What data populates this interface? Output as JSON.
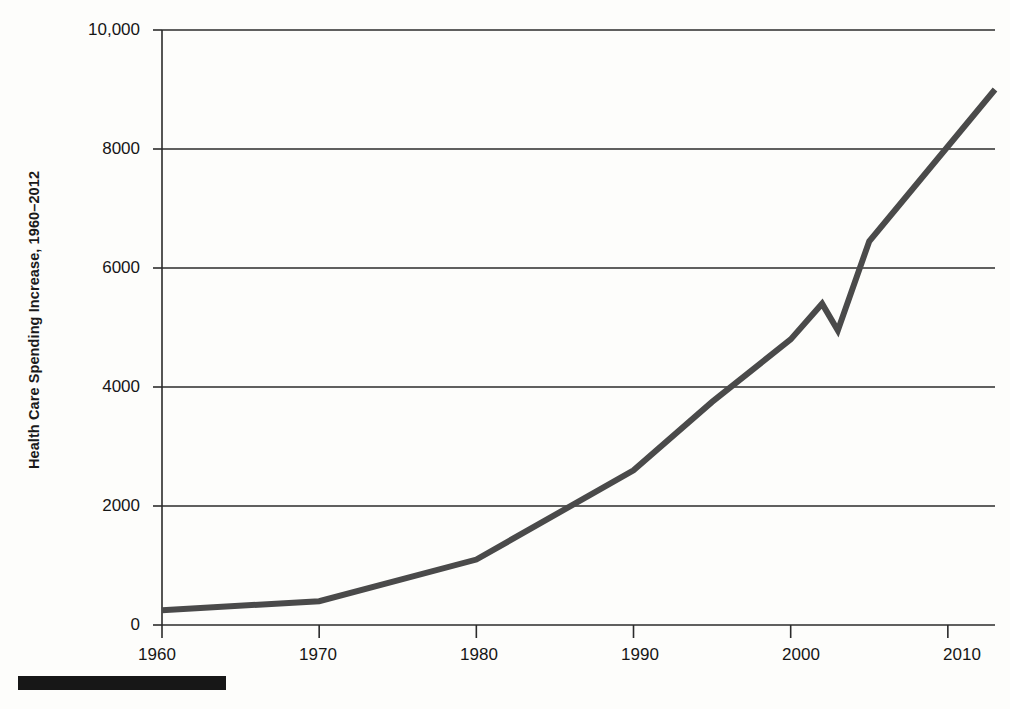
{
  "chart_data": {
    "type": "line",
    "title": "",
    "subtitle": "",
    "xlabel": "",
    "ylabel": "Health Care Spending Increase, 1960–2012",
    "xlim": [
      1960,
      2013
    ],
    "ylim": [
      0,
      10000
    ],
    "grid": "horizontal",
    "legend": "none",
    "xticks": [
      "1960",
      "1970",
      "1980",
      "1990",
      "2000",
      "2010"
    ],
    "xtick_values": [
      1960,
      1970,
      1980,
      1990,
      2000,
      2010
    ],
    "yticks": [
      "0",
      "2000",
      "4000",
      "6000",
      "8000",
      "10,000"
    ],
    "ytick_values": [
      0,
      2000,
      4000,
      6000,
      8000,
      10000
    ],
    "series": [
      {
        "name": "Health Care Spending Increase",
        "color": "#4a4a4a",
        "line_width": 6,
        "x": [
          1960,
          1970,
          1980,
          1990,
          1995,
          2000,
          2002,
          2003,
          2005,
          2013
        ],
        "values": [
          250,
          400,
          1100,
          2600,
          3750,
          4800,
          5400,
          4950,
          6450,
          9000
        ]
      }
    ],
    "annotations": []
  },
  "axis": {
    "y_label": "Health Care Spending Increase, 1960–2012",
    "y_tick_labels": [
      "10,000",
      "8000",
      "6000",
      "4000",
      "2000",
      "0"
    ],
    "x_tick_labels": [
      "1960",
      "1970",
      "1980",
      "1990",
      "2000",
      "2010"
    ]
  },
  "colors": {
    "line": "#4a4a4a",
    "grid": "#2b2b2b",
    "axis": "#2b2b2b",
    "text": "#161616",
    "background": "#fdfdfb",
    "footer_bar": "#171717"
  }
}
